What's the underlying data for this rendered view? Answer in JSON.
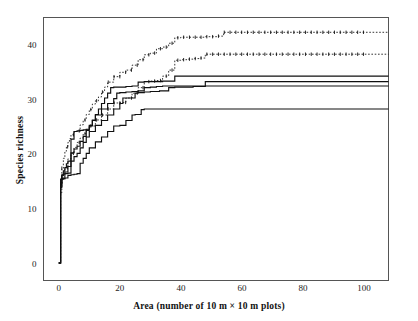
{
  "chart_data": {
    "type": "line",
    "title": "",
    "xlabel": "Area (number of 10 m × 10 m plots)",
    "ylabel": "Species richness",
    "xlim": [
      -5,
      108
    ],
    "ylim": [
      -3,
      45
    ],
    "xticks": [
      0,
      20,
      40,
      60,
      80,
      100
    ],
    "yticks": [
      0,
      10,
      20,
      30,
      40
    ],
    "grid": false,
    "legend": "none",
    "frame": true,
    "series": [
      {
        "name": "curve-1-dashed-upper",
        "style": "dashed",
        "marker": "tick",
        "plateau": 42.3,
        "x": [
          0,
          0.6,
          1,
          1.5,
          2,
          2.5,
          3,
          3.5,
          4,
          5,
          6,
          7,
          8,
          9,
          10,
          11,
          12,
          13,
          14,
          15,
          16,
          18,
          20,
          22,
          24,
          26,
          28,
          30,
          32,
          34,
          36,
          38,
          40,
          44,
          48,
          52,
          54,
          60,
          70,
          80,
          90,
          100
        ],
        "y": [
          0.2,
          14,
          17.5,
          19.3,
          20.6,
          21.4,
          22.2,
          22.9,
          23.6,
          24.2,
          24.3,
          25.4,
          26.3,
          27.3,
          28.2,
          29.2,
          29.8,
          30.5,
          31.4,
          32.3,
          33.2,
          34.2,
          35.0,
          35.4,
          36.3,
          37.3,
          38.2,
          38.5,
          39.3,
          39.6,
          40.3,
          41.3,
          41.4,
          41.4,
          41.5,
          41.6,
          42.3,
          42.3,
          42.3,
          42.3,
          42.3,
          42.3
        ]
      },
      {
        "name": "curve-2-dashed-lower",
        "style": "dashed",
        "marker": "tick",
        "plateau": 38.3,
        "x": [
          0,
          0.6,
          1,
          1.5,
          2,
          3,
          4,
          5,
          6,
          7,
          8,
          9,
          10,
          12,
          14,
          16,
          18,
          20,
          22,
          24,
          26,
          28,
          30,
          32,
          34,
          36,
          38,
          40,
          42,
          44,
          46,
          48,
          50,
          56,
          62,
          70,
          80,
          90,
          100
        ],
        "y": [
          0.2,
          13,
          15.8,
          16.8,
          17.6,
          19.2,
          20.2,
          21.3,
          22.2,
          23.0,
          23.8,
          24.5,
          25.2,
          26.3,
          27.2,
          28.3,
          29.4,
          29.5,
          30.3,
          31.2,
          32.2,
          33.3,
          33.4,
          33.5,
          34.3,
          35.4,
          37.2,
          37.3,
          37.4,
          37.5,
          37.6,
          38.3,
          38.3,
          38.3,
          38.3,
          38.3,
          38.3,
          38.3,
          38.3
        ]
      },
      {
        "name": "curve-3-solid-34",
        "style": "solid",
        "marker": "none",
        "plateau": 34.3,
        "x": [
          0,
          0.6,
          1,
          1.5,
          2,
          2.5,
          3,
          4,
          5,
          6,
          7,
          8,
          9,
          10,
          11,
          12,
          13,
          14,
          15,
          16,
          17,
          18,
          19,
          20,
          22,
          24,
          26,
          28,
          30,
          34,
          38,
          39,
          46,
          60,
          80,
          100
        ],
        "y": [
          0.2,
          14.5,
          16.2,
          17.0,
          17.6,
          18.3,
          18.8,
          20.3,
          21.0,
          21.5,
          22.4,
          23.3,
          24.4,
          25.3,
          26.3,
          27.3,
          28.3,
          29.3,
          30.3,
          31.2,
          32.2,
          32.3,
          32.3,
          32.3,
          32.4,
          32.5,
          33.2,
          33.3,
          33.3,
          33.4,
          34.3,
          34.3,
          34.3,
          34.3,
          34.3,
          34.3
        ]
      },
      {
        "name": "curve-4-solid-33",
        "style": "solid",
        "marker": "none",
        "plateau": 33.3,
        "x": [
          0,
          0.6,
          1,
          2,
          3,
          4,
          5,
          6,
          7,
          8,
          9,
          10,
          12,
          14,
          16,
          18,
          20,
          21,
          23,
          25,
          26,
          28,
          30,
          33,
          36,
          38,
          40,
          44,
          48,
          49,
          55,
          70,
          85,
          100
        ],
        "y": [
          0.2,
          14.0,
          15.6,
          16.8,
          17.8,
          18.8,
          19.6,
          20.2,
          21.2,
          22.2,
          23.2,
          24.2,
          25.3,
          26.2,
          27.2,
          28.3,
          29.3,
          30.3,
          30.3,
          31.2,
          31.3,
          31.4,
          31.5,
          31.6,
          32.2,
          32.3,
          32.3,
          32.4,
          33.3,
          33.3,
          33.3,
          33.3,
          33.3,
          33.3
        ]
      },
      {
        "name": "curve-5-solid-32",
        "style": "solid",
        "marker": "none",
        "plateau": 32.5,
        "x": [
          0,
          0.6,
          1,
          1.5,
          2,
          3,
          4,
          5,
          6,
          7,
          8,
          9,
          10,
          11,
          12,
          14,
          16,
          18,
          19,
          20,
          22,
          24,
          26,
          28,
          30,
          32,
          34,
          36,
          38,
          40,
          44,
          48,
          60,
          80,
          100
        ],
        "y": [
          0.2,
          15.5,
          16.3,
          16.4,
          16.5,
          16.6,
          22.8,
          24.2,
          24.3,
          24.4,
          24.5,
          24.6,
          25.2,
          26.2,
          27.2,
          28.3,
          29.3,
          30.2,
          31.2,
          31.3,
          31.4,
          31.5,
          31.6,
          32.2,
          32.3,
          32.4,
          32.5,
          32.5,
          32.5,
          32.5,
          32.5,
          32.5,
          32.5,
          32.5,
          32.5
        ]
      },
      {
        "name": "curve-6-solid-28",
        "style": "solid",
        "marker": "none",
        "plateau": 28.3,
        "x": [
          0,
          0.6,
          1,
          1.5,
          2,
          3,
          4,
          5,
          6,
          7,
          8,
          9,
          10,
          12,
          14,
          16,
          18,
          20,
          22,
          24,
          25,
          27,
          28,
          34,
          40,
          50,
          60,
          80,
          100
        ],
        "y": [
          0.2,
          14.8,
          15.5,
          15.6,
          15.7,
          16.2,
          16.3,
          16.4,
          16.5,
          18.4,
          19.3,
          20.2,
          21.2,
          22.3,
          23.2,
          24.2,
          25.2,
          25.3,
          26.2,
          27.2,
          27.3,
          28.2,
          28.3,
          28.3,
          28.3,
          28.3,
          28.3,
          28.3,
          28.3
        ]
      }
    ]
  },
  "colors": {
    "frame": "#4d4d4d",
    "line": "#101010",
    "text": "#1a1a1a"
  }
}
